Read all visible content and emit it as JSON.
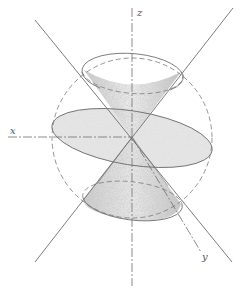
{
  "figure": {
    "axes": {
      "x_label": "x",
      "y_label": "y",
      "z_label": "z"
    },
    "colors": {
      "line": "#6e6e6e",
      "plane_fill": "#e6e6e6",
      "cone_shade": "#cfcfcf",
      "background": "#ffffff"
    }
  }
}
